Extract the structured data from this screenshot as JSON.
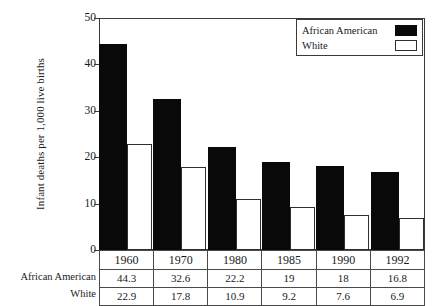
{
  "chart_data": {
    "type": "bar",
    "title": "",
    "xlabel": "",
    "ylabel": "Infant deaths per 1,000 live births",
    "ylim": [
      0,
      50
    ],
    "yticks": [
      0,
      10,
      20,
      30,
      40,
      50
    ],
    "ytick_labels": [
      "0",
      "10",
      "20",
      "30",
      "40",
      "50"
    ],
    "grid": false,
    "legend_position": "top-right",
    "categories": [
      "1960",
      "1970",
      "1980",
      "1985",
      "1990",
      "1992"
    ],
    "series": [
      {
        "name": "African American",
        "color": "#090909",
        "values": [
          44.3,
          32.6,
          22.2,
          19,
          18,
          16.8
        ],
        "value_labels": [
          "44.3",
          "32.6",
          "22.2",
          "19",
          "18",
          "16.8"
        ]
      },
      {
        "name": "White",
        "color": "#ffffff",
        "values": [
          22.9,
          17.8,
          10.9,
          9.2,
          7.6,
          6.9
        ],
        "value_labels": [
          "22.9",
          "17.8",
          "10.9",
          "9.2",
          "7.6",
          "6.9"
        ]
      }
    ]
  },
  "legend": {
    "entries": [
      {
        "label": "African American",
        "swatch": "filled-black-swatch"
      },
      {
        "label": "White",
        "swatch": "outlined-white-swatch"
      }
    ]
  },
  "table": {
    "row_labels": [
      "African American",
      "White"
    ]
  }
}
